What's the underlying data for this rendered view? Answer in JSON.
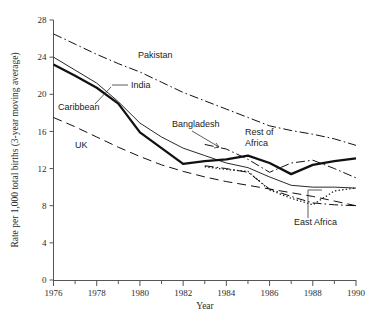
{
  "chart_data": {
    "type": "line",
    "title": "",
    "xlabel": "Year",
    "ylabel": "Rate per 1,000 total births (3-year moving average)",
    "xlim": [
      1976,
      1990
    ],
    "ylim": [
      0,
      28
    ],
    "yticks": [
      0,
      4,
      8,
      12,
      16,
      20,
      24,
      28
    ],
    "xticks": [
      1976,
      1977,
      1978,
      1979,
      1980,
      1981,
      1982,
      1983,
      1984,
      1985,
      1986,
      1987,
      1988,
      1989,
      1990
    ],
    "xtick_labels": [
      "1976",
      "",
      "1978",
      "",
      "1980",
      "",
      "1982",
      "",
      "1984",
      "",
      "1986",
      "",
      "1988",
      "",
      "1990"
    ],
    "grid": false,
    "legend": "inline-annotations",
    "x": [
      1976,
      1977,
      1978,
      1979,
      1980,
      1981,
      1982,
      1983,
      1984,
      1985,
      1986,
      1987,
      1988,
      1989,
      1990
    ],
    "series": [
      {
        "name": "Pakistan",
        "style": "dash-dot",
        "values": [
          26.5,
          25.4,
          24.3,
          23.3,
          22.4,
          21.3,
          20.2,
          19.3,
          18.4,
          17.5,
          16.6,
          16.1,
          15.7,
          15.2,
          14.5
        ]
      },
      {
        "name": "India",
        "style": "thin-solid",
        "values": [
          24.0,
          22.6,
          21.2,
          19.2,
          16.9,
          15.4,
          14.2,
          13.4,
          12.6,
          12.1,
          11.1,
          10.2,
          10.0,
          10.0,
          9.9
        ]
      },
      {
        "name": "Caribbean",
        "style": "thick-solid",
        "values": [
          23.2,
          22.0,
          20.7,
          19.0,
          15.9,
          14.2,
          12.5,
          12.8,
          13.0,
          13.4,
          12.6,
          11.4,
          12.4,
          12.8,
          13.1
        ]
      },
      {
        "name": "Bangladesh",
        "style": "dash-dot",
        "values": [
          null,
          null,
          null,
          null,
          null,
          null,
          null,
          14.6,
          14.1,
          13.0,
          11.6,
          12.6,
          12.9,
          12.0,
          11.0
        ]
      },
      {
        "name": "Rest of Africa",
        "style": "dash-dot",
        "values": [
          null,
          null,
          null,
          null,
          null,
          null,
          null,
          12.3,
          12.0,
          11.6,
          9.8,
          9.0,
          8.3,
          8.1,
          8.0
        ]
      },
      {
        "name": "East Africa",
        "style": "dotted",
        "values": [
          null,
          null,
          null,
          null,
          null,
          null,
          null,
          12.2,
          11.9,
          11.7,
          9.7,
          8.8,
          8.1,
          9.6,
          9.9
        ]
      },
      {
        "name": "UK",
        "style": "long-dash",
        "values": [
          17.5,
          16.5,
          15.4,
          14.3,
          13.3,
          12.4,
          11.7,
          11.1,
          10.6,
          10.2,
          9.8,
          9.4,
          9.0,
          8.5,
          8.0
        ]
      }
    ],
    "annotations": [
      {
        "name": "Pakistan",
        "text": "Pakistan",
        "x": 138,
        "y": 58,
        "leader": false
      },
      {
        "name": "India",
        "text": "India",
        "x": 131,
        "y": 88,
        "leader": true
      },
      {
        "name": "Caribbean",
        "text": "Caribbean",
        "x": 58,
        "y": 110,
        "leader": true
      },
      {
        "name": "Bangladesh",
        "text": "Bangladesh",
        "x": 172,
        "y": 127,
        "leader": true
      },
      {
        "name": "Rest of Africa",
        "text": "Rest of",
        "text2": "Africa",
        "x": 245,
        "y": 135,
        "leader": false
      },
      {
        "name": "UK",
        "text": "UK",
        "x": 75,
        "y": 148,
        "leader": false
      },
      {
        "name": "East Africa",
        "text": "East Africa",
        "x": 294,
        "y": 225,
        "leader": true
      }
    ]
  }
}
